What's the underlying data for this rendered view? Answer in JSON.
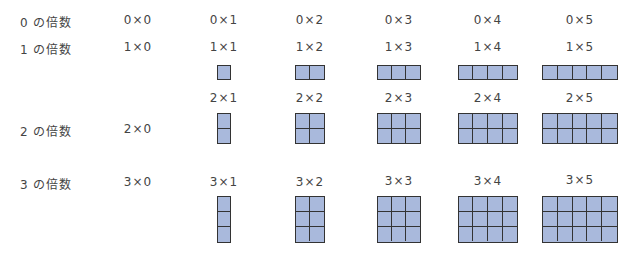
{
  "rows": [
    {
      "label": "0 の倍数",
      "multiplier": 0,
      "exprs": [
        "0×0",
        "0×1",
        "0×2",
        "0×3",
        "0×4",
        "0×5"
      ]
    },
    {
      "label": "1 の倍数",
      "multiplier": 1,
      "exprs": [
        "1×0",
        "1×1",
        "1×2",
        "1×3",
        "1×4",
        "1×5"
      ]
    },
    {
      "label": "2 の倍数",
      "multiplier": 2,
      "exprs": [
        "2×0",
        "2×1",
        "2×2",
        "2×3",
        "2×4",
        "2×5"
      ]
    },
    {
      "label": "3 の倍数",
      "multiplier": 3,
      "exprs": [
        "3×0",
        "3×1",
        "3×2",
        "3×3",
        "3×4",
        "3×5"
      ]
    }
  ],
  "colors": {
    "cell_fill": "#a9b9dc",
    "cell_border": "#333333",
    "text": "#444444"
  }
}
